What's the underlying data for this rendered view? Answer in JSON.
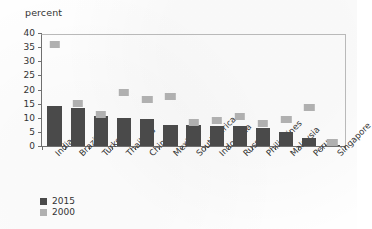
{
  "chart_data": {
    "type": "bar",
    "title": "",
    "xlabel": "",
    "ylabel": "percent",
    "ylim": [
      0,
      40
    ],
    "yticks": [
      0,
      5,
      10,
      15,
      20,
      25,
      30,
      35,
      40
    ],
    "grid": false,
    "legend_position": "bottom-left",
    "categories": [
      "India",
      "Brazil",
      "Turkey",
      "Thailand",
      "China",
      "Mexico",
      "South Africa",
      "Indonesia",
      "Russia",
      "Philippines",
      "Malaysia",
      "Peru",
      "Singapore"
    ],
    "series": [
      {
        "name": "2015",
        "style": "bar",
        "color": "#4a4a4a",
        "values": [
          14,
          13.5,
          10.5,
          10,
          9.5,
          7.5,
          7.5,
          7,
          7,
          6.5,
          5,
          3,
          0.5
        ]
      },
      {
        "name": "2000",
        "style": "marker",
        "color": "#b0b0b0",
        "values": [
          36,
          15,
          11,
          19,
          16.5,
          17.5,
          8.5,
          9,
          10.5,
          8,
          9.5,
          13.5,
          0.5
        ]
      }
    ]
  },
  "axis": {
    "y_label": "percent"
  },
  "legend": {
    "items": [
      {
        "label": "2015",
        "color": "#4a4a4a"
      },
      {
        "label": "2000",
        "color": "#b0b0b0"
      }
    ]
  }
}
